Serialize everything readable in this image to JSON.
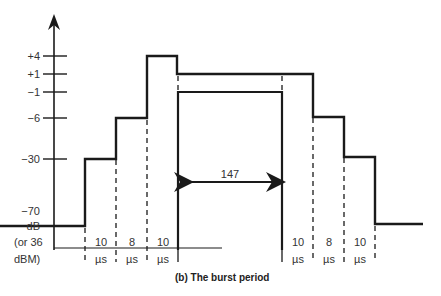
{
  "figure": {
    "caption": "(b) The burst period",
    "y_axis": {
      "ticks": [
        {
          "label": "+4",
          "y": 56
        },
        {
          "label": "+1",
          "y": 74
        },
        {
          "label": "−1",
          "y": 92
        },
        {
          "label": "−6",
          "y": 118
        },
        {
          "label": "−30",
          "y": 159
        }
      ],
      "bottom_label_lines": [
        "−70",
        "dB",
        "(or 36",
        "dBM)"
      ]
    },
    "interval_labels_left": [
      {
        "value": "10",
        "unit": "µs"
      },
      {
        "value": "8",
        "unit": "µs"
      },
      {
        "value": "10",
        "unit": "µs"
      }
    ],
    "interval_labels_right": [
      {
        "value": "10",
        "unit": "µs"
      },
      {
        "value": "8",
        "unit": "µs"
      },
      {
        "value": "10",
        "unit": "µs"
      }
    ],
    "burst_duration_label": "147",
    "colors": {
      "line": "#1a1a1a",
      "text": "#333333",
      "background": "#ffffff"
    }
  }
}
